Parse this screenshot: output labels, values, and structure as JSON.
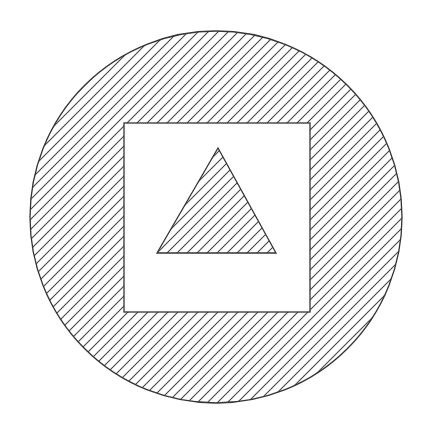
{
  "diagram": {
    "background": "#ffffff",
    "stroke_color": "#333333",
    "hatch": {
      "angle_deg": 45,
      "direction": "lower-left to upper-right",
      "spacing_px": 10,
      "color": "#444444"
    },
    "shapes": [
      {
        "id": "outer-circle",
        "type": "circle",
        "cx": 216,
        "cy": 217,
        "r": 186,
        "fill": "hatched"
      },
      {
        "id": "inner-square",
        "type": "rect",
        "x": 124,
        "y": 123,
        "width": 186,
        "height": 189,
        "fill": "white"
      },
      {
        "id": "inner-triangle",
        "type": "triangle",
        "points": [
          [
            218,
            148
          ],
          [
            157,
            253
          ],
          [
            276,
            253
          ]
        ],
        "fill": "hatched"
      }
    ]
  }
}
